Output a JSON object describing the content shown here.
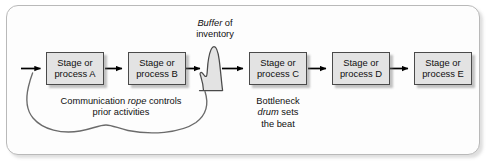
{
  "diagram": {
    "frame": {
      "border_color": "#b9b9b9",
      "fill": "#fdfdfd"
    },
    "box_style": {
      "fill": "#e3e3e3",
      "stroke": "#4a4a4a"
    },
    "flow_color": "#000000",
    "rope_color": "#6b6b6b",
    "buffer_fill": "#e3e3e3",
    "buffer_stroke": "#4a4a4a",
    "stages": [
      {
        "line1": "Stage or",
        "line2": "process A"
      },
      {
        "line1": "Stage or",
        "line2": "process B"
      },
      {
        "line1": "Stage or",
        "line2": "process C"
      },
      {
        "line1": "Stage or",
        "line2": "process D"
      },
      {
        "line1": "Stage or",
        "line2": "process E"
      }
    ],
    "buffer_label": {
      "line1_italic": "Buffer",
      "line1_rest": " of",
      "line2": "inventory"
    },
    "rope_caption": {
      "line1_pre": "Communication ",
      "line1_italic": "rope",
      "line1_post": " controls",
      "line2": "prior activities"
    },
    "drum_caption": {
      "line1": "Bottleneck",
      "line2_italic": "drum",
      "line2_rest": " sets",
      "line3": "the beat"
    }
  }
}
